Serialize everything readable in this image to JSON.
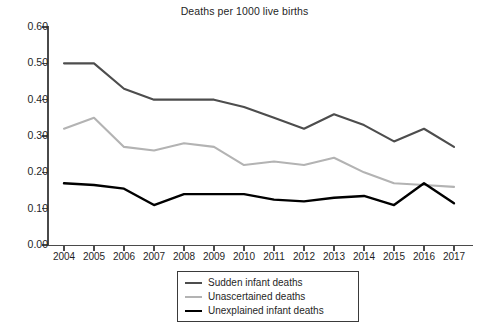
{
  "chart_data": {
    "type": "line",
    "title": "Deaths per 1000 live births",
    "xlabel": "",
    "ylabel": "",
    "x": [
      2004,
      2005,
      2006,
      2007,
      2008,
      2009,
      2010,
      2011,
      2012,
      2013,
      2014,
      2015,
      2016,
      2017
    ],
    "categories": [
      "2004",
      "2005",
      "2006",
      "2007",
      "2008",
      "2009",
      "2010",
      "2011",
      "2012",
      "2013",
      "2014",
      "2015",
      "2016",
      "2017"
    ],
    "xlim": [
      2004,
      2017
    ],
    "ylim": [
      0.0,
      0.6
    ],
    "ytick_labels": [
      "0.60",
      "0.50",
      "0.40",
      "0.30",
      "0.20",
      "0.10",
      "0.00"
    ],
    "ytick_values": [
      0.6,
      0.5,
      0.4,
      0.3,
      0.2,
      0.1,
      0.0
    ],
    "grid": false,
    "legend_position": "bottom-center",
    "series": [
      {
        "name": "Sudden infant deaths",
        "color": "#4d4d4d",
        "width": 2.1,
        "values": [
          0.5,
          0.5,
          0.43,
          0.4,
          0.4,
          0.4,
          0.38,
          0.35,
          0.32,
          0.36,
          0.33,
          0.285,
          0.32,
          0.27
        ]
      },
      {
        "name": "Unascertained deaths",
        "color": "#b3b3b3",
        "width": 2.1,
        "values": [
          0.32,
          0.35,
          0.27,
          0.26,
          0.28,
          0.27,
          0.22,
          0.23,
          0.22,
          0.24,
          0.2,
          0.17,
          0.165,
          0.16
        ]
      },
      {
        "name": "Unexplained infant deaths",
        "color": "#000000",
        "width": 2.4,
        "values": [
          0.17,
          0.165,
          0.155,
          0.11,
          0.14,
          0.14,
          0.14,
          0.125,
          0.12,
          0.13,
          0.135,
          0.11,
          0.17,
          0.115
        ]
      }
    ]
  },
  "title": "Deaths per 1000 live births",
  "legend": {
    "items": [
      {
        "label": "Sudden infant deaths",
        "color": "#4d4d4d",
        "width": 2.1
      },
      {
        "label": "Unascertained deaths",
        "color": "#b3b3b3",
        "width": 2.1
      },
      {
        "label": "Unexplained infant deaths",
        "color": "#000000",
        "width": 2.4
      }
    ]
  },
  "colors": {
    "axis": "#4a4a4a",
    "text": "#1f1f1f",
    "background": "#ffffff"
  }
}
